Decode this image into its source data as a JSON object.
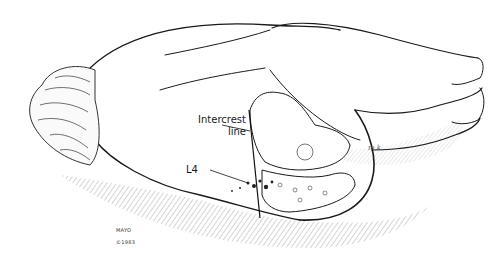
{
  "figure": {
    "labels": {
      "intercrest_line": "Intercrest\nline",
      "l4": "L4"
    },
    "signature": {
      "studio": "MAYO",
      "copyright": "©1983"
    },
    "artist_mark": "m.k."
  },
  "colors": {
    "background": "#ffffff",
    "ink": "#1a1a1a",
    "hatch": "#555555"
  }
}
